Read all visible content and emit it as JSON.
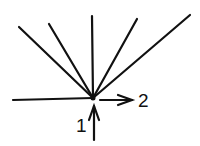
{
  "diagram": {
    "labels": {
      "one": "1",
      "two": "2"
    },
    "origin": [
      93,
      98
    ],
    "rays": [
      [
        19,
        27
      ],
      [
        49,
        24
      ],
      [
        92,
        16
      ],
      [
        137,
        19
      ],
      [
        190,
        15
      ]
    ],
    "colors": {
      "stroke": "#111111",
      "background": "#ffffff"
    }
  }
}
